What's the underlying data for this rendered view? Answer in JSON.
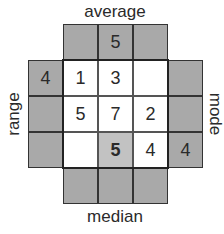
{
  "labels": {
    "top": "average",
    "bottom": "median",
    "left": "range",
    "right": "mode"
  },
  "top_row": [
    "",
    "5",
    ""
  ],
  "bottom_row": [
    "",
    "",
    ""
  ],
  "left_column": [
    "4",
    "",
    ""
  ],
  "right_column": [
    "",
    "",
    "4"
  ],
  "grid": [
    [
      "1",
      "3",
      ""
    ],
    [
      "5",
      "7",
      "2"
    ],
    [
      "",
      "5",
      "4"
    ]
  ],
  "highlighted_cell": {
    "row": 2,
    "col": 1
  },
  "colors": {
    "shaded": "#a9a9a9",
    "highlight": "#c2c2c2",
    "inner": "#ffffff",
    "border": "#333333",
    "text": "#2a2a2a"
  }
}
